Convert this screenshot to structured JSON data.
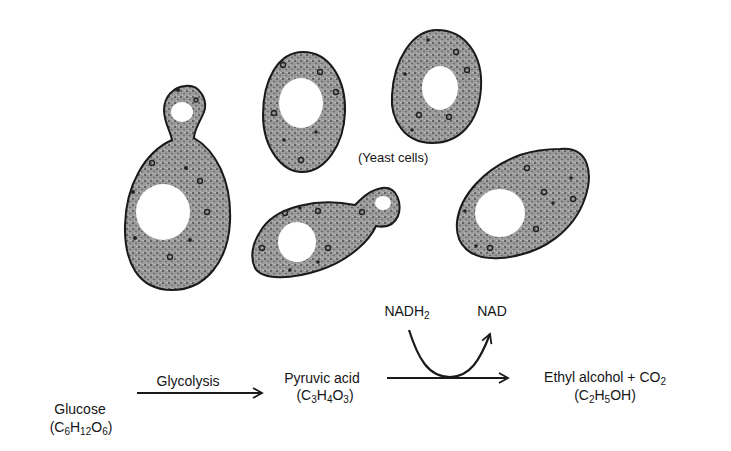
{
  "figure": {
    "cells_label": "(Yeast cells)",
    "cells": [
      {
        "id": "budding-cell-left",
        "type": "budding"
      },
      {
        "id": "oval-cell-top-middle",
        "type": "oval"
      },
      {
        "id": "oval-cell-top-right",
        "type": "oval"
      },
      {
        "id": "budding-cell-bottom-middle",
        "type": "budding"
      },
      {
        "id": "oval-cell-right",
        "type": "oval"
      }
    ],
    "colors": {
      "cell_fill": "#8a8a8a",
      "cell_outline": "#1a1a1a",
      "vacuole": "#ffffff",
      "text": "#151515"
    }
  },
  "pathway": {
    "glucose": {
      "name": "Glucose",
      "formula": {
        "pre": "(C",
        "s1": "6",
        "m1": "H",
        "s2": "12",
        "m2": "O",
        "s3": "6",
        "post": ")"
      }
    },
    "step1_label": "Glycolysis",
    "pyruvic": {
      "name": "Pyruvic acid",
      "formula": {
        "pre": "(C",
        "s1": "3",
        "m1": "H",
        "s2": "4",
        "m2": "O",
        "s3": "3",
        "post": ")"
      }
    },
    "cofactor_in": {
      "base": "NADH",
      "sub": "2"
    },
    "cofactor_out": "NAD",
    "product": {
      "name": "Ethyl alcohol + CO",
      "name_sub": "2",
      "formula": {
        "pre": "(C",
        "s1": "2",
        "m1": "H",
        "s2": "5",
        "post": "OH)"
      }
    }
  }
}
